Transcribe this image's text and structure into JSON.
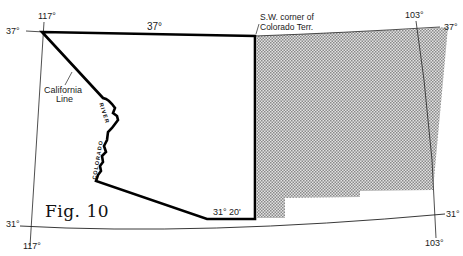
{
  "figure": {
    "caption": "Fig. 10",
    "colors": {
      "ink": "#111111",
      "shade": "#bdbdbd",
      "background": "#ffffff"
    }
  },
  "graticule": {
    "meridians": [
      {
        "label_top": "117°",
        "label_bottom": "117°"
      },
      {
        "label_top": "103°",
        "label_bottom": "103°"
      }
    ],
    "parallels": [
      {
        "label_left": "37°",
        "label_right": "37°"
      },
      {
        "label_left": "31°",
        "label_right": "31°"
      }
    ]
  },
  "boundary_labels": {
    "north_border": "37°",
    "south_border": "31° 20'",
    "california_line_1": "California",
    "california_line_2": "Line",
    "river_word_1": "RIVER",
    "river_word_2": "COLORADO",
    "sw_corner_line_1": "S.W. corner of",
    "sw_corner_line_2": "Colorado Terr."
  }
}
